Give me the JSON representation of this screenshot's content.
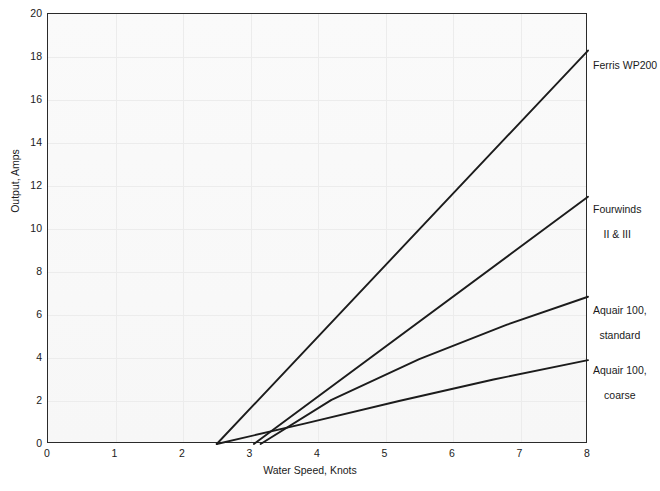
{
  "top_fragment": "",
  "chart_data": {
    "type": "line",
    "title": "",
    "xlabel": "Water Speed, Knots",
    "ylabel": "Output, Amps",
    "xlim": [
      0,
      8
    ],
    "ylim": [
      0,
      20
    ],
    "xticks": [
      "0",
      "1",
      "2",
      "3",
      "4",
      "5",
      "6",
      "7",
      "8"
    ],
    "yticks": [
      "0",
      "2",
      "4",
      "6",
      "8",
      "10",
      "12",
      "14",
      "16",
      "18",
      "20"
    ],
    "grid": true,
    "legend_position": "right-of-axes (direct series labels)",
    "series": [
      {
        "name": "Ferris WP200",
        "label_lines": [
          "Ferris WP200"
        ],
        "x": [
          2.5,
          8.0
        ],
        "y": [
          0.0,
          18.3
        ],
        "label_at": {
          "x": 8.0,
          "y": 18.3
        }
      },
      {
        "name": "Fourwinds II & III",
        "label_lines": [
          "Fourwinds",
          "II & III"
        ],
        "x": [
          3.05,
          8.0
        ],
        "y": [
          0.0,
          11.5
        ],
        "label_at": {
          "x": 8.0,
          "y": 11.5
        }
      },
      {
        "name": "Aquair 100, standard",
        "label_lines": [
          "Aquair 100,",
          "standard"
        ],
        "x": [
          3.15,
          4.2,
          5.5,
          6.8,
          8.0
        ],
        "y": [
          0.0,
          2.05,
          3.95,
          5.55,
          6.85
        ],
        "label_at": {
          "x": 8.0,
          "y": 6.85
        }
      },
      {
        "name": "Aquair 100, coarse",
        "label_lines": [
          "Aquair 100,",
          "coarse"
        ],
        "x": [
          2.5,
          3.8,
          5.2,
          6.6,
          8.0
        ],
        "y": [
          0.0,
          0.95,
          2.0,
          3.0,
          3.9
        ],
        "label_at": {
          "x": 8.0,
          "y": 3.9
        }
      }
    ],
    "colors": {
      "curve": "#1c1c1c",
      "axis": "#2a2a2a",
      "grid": "#ececec",
      "plot_background": "#fbfbfb",
      "page_background": "#ffffff",
      "text": "#1a1a1a"
    }
  },
  "series_labels": {
    "s0": "Ferris WP200",
    "s1_line1": "Fourwinds",
    "s1_line2": "II & III",
    "s2_line1": "Aquair 100,",
    "s2_line2": "standard",
    "s3_line1": "Aquair 100,",
    "s3_line2": "coarse"
  },
  "axes": {
    "y_0": "0",
    "y_2": "2",
    "y_4": "4",
    "y_6": "6",
    "y_8": "8",
    "y_10": "10",
    "y_12": "12",
    "y_14": "14",
    "y_16": "16",
    "y_18": "18",
    "y_20": "20",
    "x_0": "0",
    "x_1": "1",
    "x_2": "2",
    "x_3": "3",
    "x_4": "4",
    "x_5": "5",
    "x_6": "6",
    "x_7": "7",
    "x_8": "8",
    "x_title": "Water Speed, Knots",
    "y_title": "Output, Amps"
  }
}
